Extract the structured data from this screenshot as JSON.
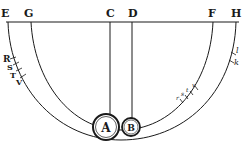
{
  "diagram": {
    "top_labels": [
      {
        "id": "E",
        "text": "E",
        "x": 7
      },
      {
        "id": "G",
        "text": "G",
        "x": 30
      },
      {
        "id": "C",
        "text": "C",
        "x": 110
      },
      {
        "id": "D",
        "text": "D",
        "x": 132
      },
      {
        "id": "F",
        "text": "F",
        "x": 213
      },
      {
        "id": "H",
        "text": "H",
        "x": 236
      }
    ],
    "bobs": [
      {
        "id": "A",
        "text": "A",
        "cx": 106,
        "cy": 127,
        "r": 13
      },
      {
        "id": "B",
        "text": "B",
        "cx": 131,
        "cy": 127,
        "r": 9
      }
    ],
    "left_arc_marks": [
      "R",
      "S",
      "T",
      "V"
    ],
    "right_arc_marks": [
      "r",
      "s",
      "t",
      "v"
    ],
    "right_outer_marks": [
      "l",
      "k"
    ],
    "colors": {
      "ink": "#1a1a1a",
      "paper": "#ffffff"
    }
  }
}
